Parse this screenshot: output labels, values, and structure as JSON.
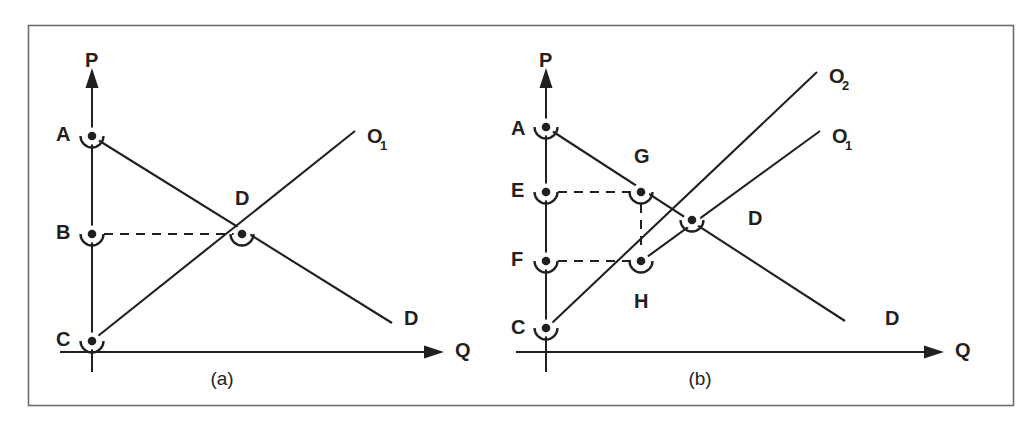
{
  "figure": {
    "background_color": "#ffffff",
    "ink_color": "#231f20",
    "frame_color": "#6e6e6e",
    "panels": [
      {
        "id": "panel-a",
        "caption": "(a)",
        "axis_y_label": "P",
        "axis_x_label": "Q",
        "points": [
          {
            "id": "A",
            "label": "A",
            "x": 92,
            "y": 136
          },
          {
            "id": "B",
            "label": "B",
            "x": 92,
            "y": 234
          },
          {
            "id": "C",
            "label": "C",
            "x": 92,
            "y": 341
          },
          {
            "id": "D",
            "label": "D",
            "x": 242,
            "y": 234
          }
        ],
        "curves": [
          {
            "id": "supply-O1",
            "label": "O₁",
            "label_sub": "1",
            "label_base": "O",
            "from": {
              "x": 92,
              "y": 341
            },
            "to": {
              "x": 355,
              "y": 131
            }
          },
          {
            "id": "demand-D",
            "label": "D",
            "from": {
              "x": 92,
              "y": 136
            },
            "to": {
              "x": 392,
              "y": 323
            }
          }
        ],
        "dashed_segments": [
          {
            "id": "B-to-D",
            "from": {
              "x": 92,
              "y": 234
            },
            "to": {
              "x": 242,
              "y": 234
            }
          }
        ],
        "vertical_axis": {
          "x": 92,
          "y_top": 74,
          "y_bottom": 372
        },
        "horizontal_axis": {
          "y": 352,
          "x_left": 60,
          "x_right": 440
        }
      },
      {
        "id": "panel-b",
        "caption": "(b)",
        "axis_y_label": "P",
        "axis_x_label": "Q",
        "points": [
          {
            "id": "A",
            "label": "A",
            "x": 546,
            "y": 127
          },
          {
            "id": "E",
            "label": "E",
            "x": 546,
            "y": 192
          },
          {
            "id": "F",
            "label": "F",
            "x": 546,
            "y": 261
          },
          {
            "id": "C",
            "label": "C",
            "x": 546,
            "y": 328
          },
          {
            "id": "G",
            "label": "G",
            "x": 641,
            "y": 192
          },
          {
            "id": "H",
            "label": "H",
            "x": 641,
            "y": 261
          },
          {
            "id": "D",
            "label": "D",
            "x": 692,
            "y": 220
          }
        ],
        "curves": [
          {
            "id": "supply-O2",
            "label": "O₂",
            "label_sub": "2",
            "label_base": "O",
            "from": {
              "x": 546,
              "y": 328
            },
            "to": {
              "x": 817,
              "y": 72
            }
          },
          {
            "id": "supply-O1",
            "label": "O₁",
            "label_sub": "1",
            "label_base": "O",
            "from": {
              "x": 641,
              "y": 261
            },
            "to": {
              "x": 820,
              "y": 131
            }
          },
          {
            "id": "demand-D",
            "label": "D",
            "from": {
              "x": 546,
              "y": 127
            },
            "to": {
              "x": 845,
              "y": 321
            }
          }
        ],
        "dashed_segments": [
          {
            "id": "E-to-G",
            "from": {
              "x": 546,
              "y": 192
            },
            "to": {
              "x": 641,
              "y": 192
            }
          },
          {
            "id": "F-to-H",
            "from": {
              "x": 546,
              "y": 261
            },
            "to": {
              "x": 641,
              "y": 261
            }
          },
          {
            "id": "G-to-H",
            "from": {
              "x": 641,
              "y": 192
            },
            "to": {
              "x": 641,
              "y": 261
            }
          }
        ],
        "vertical_axis": {
          "x": 546,
          "y_top": 74,
          "y_bottom": 372
        },
        "horizontal_axis": {
          "y": 352,
          "x_left": 516,
          "x_right": 940
        }
      }
    ],
    "labels": {
      "panel_a": {
        "A": "A",
        "B": "B",
        "C": "C",
        "D_point": "D",
        "P": "P",
        "Q": "Q",
        "O1_base": "O",
        "O1_sub": "1",
        "D_curve": "D",
        "caption": "(a)"
      },
      "panel_b": {
        "A": "A",
        "E": "E",
        "F": "F",
        "C": "C",
        "G": "G",
        "H": "H",
        "D_point": "D",
        "P": "P",
        "Q": "Q",
        "O1_base": "O",
        "O1_sub": "1",
        "O2_base": "O",
        "O2_sub": "2",
        "D_curve": "D",
        "caption": "(b)"
      }
    }
  }
}
